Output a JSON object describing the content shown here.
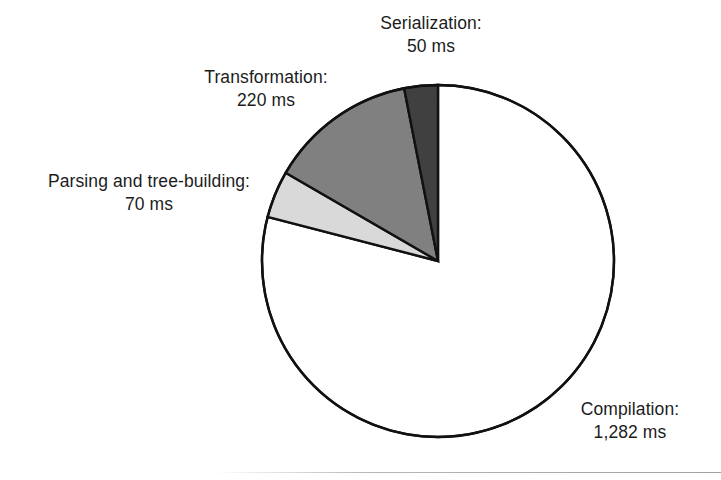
{
  "figure": {
    "background_color": "#ffffff",
    "outline_color": "#111111"
  },
  "chart_data": {
    "type": "pie",
    "title": "",
    "subtitle": "",
    "xlabel": "",
    "ylabel": "",
    "unit": "ms",
    "total": 1622,
    "legend_position": "labels-outside",
    "grid": false,
    "start_angle_deg": 90,
    "direction": "counterclockwise",
    "categories": [
      "Serialization",
      "Transformation",
      "Parsing and tree-building",
      "Compilation"
    ],
    "values": [
      50,
      220,
      70,
      1282
    ],
    "value_labels": [
      "50 ms",
      "220 ms",
      "70 ms",
      "1,282 ms"
    ],
    "colors": [
      "#404040",
      "#808080",
      "#d9d9d9",
      "#ffffff"
    ],
    "slices": [
      {
        "name": "Serialization",
        "value": 50,
        "value_label": "50 ms",
        "label_name": "Serialization:",
        "color": "#404040",
        "percent": 3.1
      },
      {
        "name": "Transformation",
        "value": 220,
        "value_label": "220 ms",
        "label_name": "Transformation:",
        "color": "#808080",
        "percent": 13.6
      },
      {
        "name": "Parsing and tree-building",
        "value": 70,
        "value_label": "70 ms",
        "label_name": "Parsing and tree-building:",
        "color": "#d9d9d9",
        "percent": 4.3
      },
      {
        "name": "Compilation",
        "value": 1282,
        "value_label": "1,282 ms",
        "label_name": "Compilation:",
        "color": "#ffffff",
        "percent": 79.0
      }
    ]
  }
}
